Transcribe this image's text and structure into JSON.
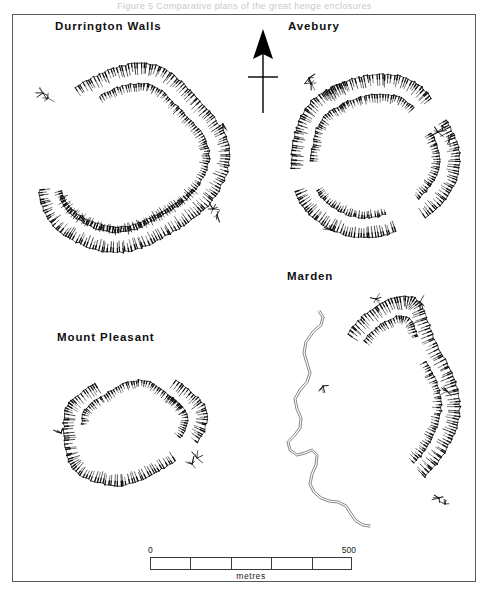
{
  "figure": {
    "top_caption": "Figure 5  Comparative plans of the great henge enclosures",
    "north_arrow_label": "north-arrow"
  },
  "sites": {
    "durrington_walls": {
      "label": "Durrington  Walls"
    },
    "avebury": {
      "label": "Avebury"
    },
    "marden": {
      "label": "Marden"
    },
    "mount_pleasant": {
      "label": "Mount  Pleasant"
    }
  },
  "scale": {
    "min_label": "0",
    "max_label": "500",
    "unit_label": "metres",
    "divisions": 5,
    "min_value": 0,
    "max_value": 500,
    "unit": "metres",
    "bar_length_px": 202
  },
  "style": {
    "ink": "#101010",
    "frame": "#5a5a5a",
    "river": "#6f6f6f",
    "paper": "#ffffff"
  },
  "earthworks": {
    "durrington_walls": {
      "name": "Durrington Walls",
      "center": [
        127,
        157
      ],
      "bands": [
        {
          "id": "dw-outer",
          "role": "outer-bank",
          "side": "in",
          "len": 4.95,
          "start": -2.05,
          "rx": 96,
          "ry": 92,
          "rot": -6,
          "wob": 5.5,
          "tick": 10.5,
          "step": 3.05,
          "jitter": 0.9
        },
        {
          "id": "dw-inner",
          "role": "inner-ditch",
          "side": "in",
          "len": 4.55,
          "start": -1.85,
          "rx": 76,
          "ry": 72,
          "rot": -6,
          "wob": 5.0,
          "tick": 7.0,
          "step": 2.75,
          "jitter": 0.8
        },
        {
          "id": "dw-inner-s",
          "role": "inner-ditch-south",
          "side": "out",
          "len": 2.15,
          "start": 0.62,
          "rx": 74,
          "ry": 67,
          "rot": -6,
          "wob": 4.0,
          "tick": 6.5,
          "step": 2.9,
          "jitter": 0.8
        }
      ],
      "tufts": [
        [
          42,
          92,
          6
        ],
        [
          212,
          208,
          6
        ],
        [
          222,
          123,
          5
        ],
        [
          47,
          97,
          5
        ],
        [
          216,
          214,
          5
        ]
      ]
    },
    "avebury": {
      "name": "Avebury",
      "center": [
        372,
        155
      ],
      "bands": [
        {
          "id": "av-outer-n",
          "role": "outer-bank",
          "side": "in",
          "len": 1.46,
          "start": -2.28,
          "rx": 84,
          "ry": 82,
          "rot": 4,
          "wob": 3.0,
          "tick": 10.5,
          "step": 3.0,
          "jitter": 0.85
        },
        {
          "id": "av-outer-e",
          "role": "outer-bank",
          "side": "in",
          "len": 1.34,
          "start": -0.52,
          "rx": 84,
          "ry": 82,
          "rot": 4,
          "wob": 3.0,
          "tick": 10.5,
          "step": 3.0,
          "jitter": 0.85
        },
        {
          "id": "av-outer-s",
          "role": "outer-bank",
          "side": "in",
          "len": 1.4,
          "start": 1.22,
          "rx": 84,
          "ry": 82,
          "rot": 4,
          "wob": 3.0,
          "tick": 10.5,
          "step": 3.0,
          "jitter": 0.85
        },
        {
          "id": "av-outer-w",
          "role": "outer-bank",
          "side": "in",
          "len": 1.36,
          "start": 2.92,
          "rx": 84,
          "ry": 82,
          "rot": 4,
          "wob": 3.0,
          "tick": 10.5,
          "step": 3.0,
          "jitter": 0.85
        },
        {
          "id": "av-inner-n",
          "role": "inner-ditch",
          "side": "in",
          "len": 1.26,
          "start": -2.16,
          "rx": 64,
          "ry": 62,
          "rot": 4,
          "wob": 2.6,
          "tick": 7.0,
          "step": 2.7,
          "jitter": 0.8
        },
        {
          "id": "av-inner-e",
          "role": "inner-ditch",
          "side": "in",
          "len": 1.16,
          "start": -0.44,
          "rx": 64,
          "ry": 62,
          "rot": 4,
          "wob": 2.6,
          "tick": 7.0,
          "step": 2.7,
          "jitter": 0.8
        },
        {
          "id": "av-inner-s",
          "role": "inner-ditch",
          "side": "in",
          "len": 1.2,
          "start": 1.3,
          "rx": 64,
          "ry": 62,
          "rot": 4,
          "wob": 2.6,
          "tick": 7.0,
          "step": 2.7,
          "jitter": 0.8
        },
        {
          "id": "av-inner-w",
          "role": "inner-ditch",
          "side": "in",
          "len": 1.18,
          "start": 3.0,
          "rx": 64,
          "ry": 62,
          "rot": 4,
          "wob": 2.6,
          "tick": 7.0,
          "step": 2.7,
          "jitter": 0.8
        }
      ],
      "tufts": [
        [
          308,
          77,
          6
        ],
        [
          437,
          131,
          6
        ],
        [
          448,
          140,
          5
        ],
        [
          330,
          229,
          5
        ],
        [
          310,
          82,
          5
        ],
        [
          441,
          125,
          5
        ]
      ]
    },
    "mount_pleasant": {
      "name": "Mount Pleasant",
      "center": [
        130,
        424
      ],
      "bands": [
        {
          "id": "mp-outer-w",
          "role": "outer-bank",
          "side": "in",
          "len": 3.3,
          "start": 1.02,
          "rx": 72,
          "ry": 57,
          "rot": -10,
          "wob": 4.6,
          "tick": 10.0,
          "step": 3.0,
          "jitter": 0.9
        },
        {
          "id": "mp-outer-e",
          "role": "outer-bank",
          "side": "in",
          "len": 1.18,
          "start": -0.64,
          "rx": 72,
          "ry": 57,
          "rot": -10,
          "wob": 4.6,
          "tick": 10.0,
          "step": 3.0,
          "jitter": 0.9
        },
        {
          "id": "mp-inner-n",
          "role": "inner-ditch",
          "side": "in",
          "len": 2.7,
          "start": 3.38,
          "rx": 53,
          "ry": 42,
          "rot": -10,
          "wob": 3.6,
          "tick": 6.5,
          "step": 2.7,
          "jitter": 0.8
        },
        {
          "id": "mp-inner-e",
          "role": "inner-ditch",
          "side": "in",
          "len": 1.05,
          "start": -0.5,
          "rx": 53,
          "ry": 42,
          "rot": -10,
          "wob": 3.6,
          "tick": 6.5,
          "step": 2.7,
          "jitter": 0.8
        }
      ],
      "tufts": [
        [
          191,
          463,
          6
        ],
        [
          196,
          457,
          5
        ],
        [
          60,
          432,
          5
        ]
      ]
    },
    "marden": {
      "name": "Marden",
      "center": [
        389,
        400
      ],
      "bands": [
        {
          "id": "md-outer",
          "role": "outer-bank",
          "side": "in",
          "len": 3.3,
          "start": -2.38,
          "rx": 62,
          "ry": 104,
          "rot": 2,
          "wob": 7.5,
          "tick": 11.5,
          "step": 3.1,
          "jitter": 1.0
        },
        {
          "id": "md-inner-n",
          "role": "inner-ditch",
          "side": "in",
          "len": 1.42,
          "start": -2.24,
          "rx": 45,
          "ry": 84,
          "rot": 2,
          "wob": 6.0,
          "tick": 7.0,
          "step": 2.8,
          "jitter": 0.85
        },
        {
          "id": "md-inner-e",
          "role": "inner-ditch",
          "side": "in",
          "len": 1.4,
          "start": -0.48,
          "rx": 45,
          "ry": 84,
          "rot": 2,
          "wob": 6.0,
          "tick": 7.0,
          "step": 2.8,
          "jitter": 0.85
        }
      ],
      "tufts": [
        [
          322,
          385,
          6
        ],
        [
          375,
          298,
          6
        ],
        [
          419,
          301,
          5
        ],
        [
          446,
          390,
          6
        ],
        [
          438,
          497,
          6
        ],
        [
          444,
          503,
          5
        ]
      ],
      "river": {
        "id": "marden-river",
        "role": "river-channel",
        "points": [
          [
            318,
            310
          ],
          [
            322,
            316
          ],
          [
            320,
            324
          ],
          [
            312,
            331
          ],
          [
            305,
            341
          ],
          [
            303,
            352
          ],
          [
            306,
            362
          ],
          [
            309,
            372
          ],
          [
            306,
            381
          ],
          [
            299,
            389
          ],
          [
            294,
            398
          ],
          [
            296,
            408
          ],
          [
            300,
            417
          ],
          [
            299,
            427
          ],
          [
            293,
            435
          ],
          [
            287,
            441
          ],
          [
            289,
            449
          ],
          [
            296,
            454
          ],
          [
            304,
            452
          ],
          [
            311,
            449
          ],
          [
            316,
            454
          ],
          [
            315,
            464
          ],
          [
            311,
            473
          ],
          [
            309,
            483
          ],
          [
            313,
            491
          ],
          [
            320,
            497
          ],
          [
            328,
            500
          ],
          [
            337,
            501
          ],
          [
            345,
            505
          ],
          [
            350,
            513
          ],
          [
            355,
            520
          ],
          [
            362,
            524
          ],
          [
            369,
            525
          ]
        ],
        "gap": 2.1
      }
    }
  },
  "north_arrow": {
    "x": 262,
    "y_top": 28,
    "y_bottom": 112,
    "head_height": 30,
    "head_half_width": 10,
    "cross_y": 76,
    "cross_half": 15
  }
}
